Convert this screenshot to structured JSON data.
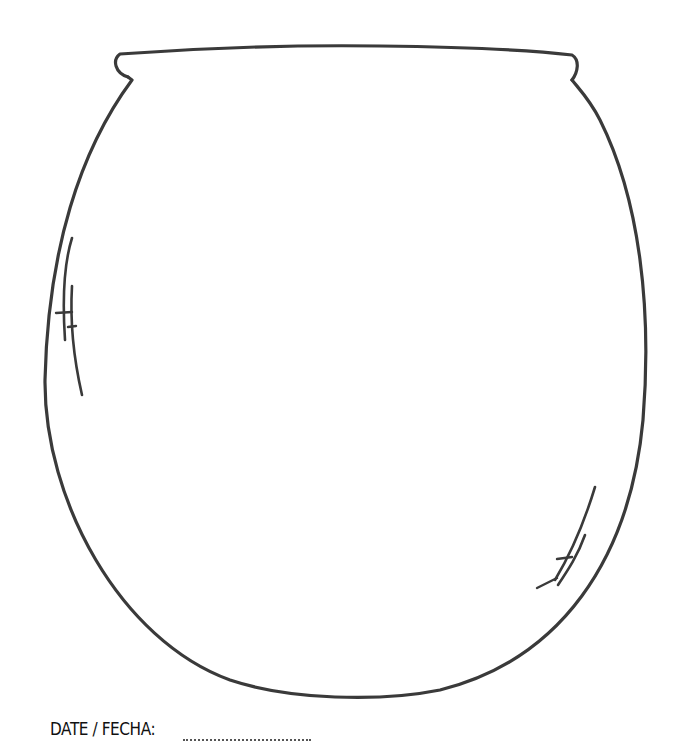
{
  "worksheet": {
    "subject": "pot-outline-coloring-page",
    "date_label": "DATE / FECHA:",
    "date_value": "",
    "stroke_color": "#3a3a3a",
    "background_color": "#ffffff"
  }
}
